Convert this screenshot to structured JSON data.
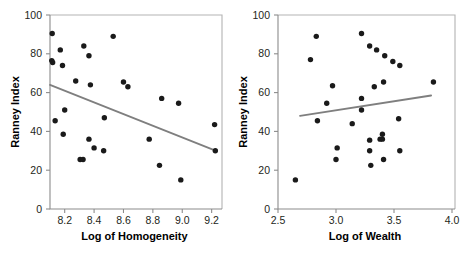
{
  "figure": {
    "background": "#ffffff",
    "dot_color": "#1a1a1a",
    "regression_line_color": "#7f7f7f",
    "axis_color": "#8c8c8c",
    "frame_color": "#b3b3b3"
  },
  "chart_data": [
    {
      "type": "scatter",
      "title": "",
      "xlabel": "Log of Homogeneity",
      "ylabel": "Ranney Index",
      "xlim": [
        8.1,
        9.25
      ],
      "ylim": [
        0,
        100
      ],
      "xticks": [
        8.2,
        8.4,
        8.6,
        8.8,
        9.0,
        9.2
      ],
      "xticklabels": [
        "8.2",
        "8.4",
        "8.6",
        "8.8",
        "9.0",
        "9.2"
      ],
      "yticks": [
        0,
        20,
        40,
        60,
        80,
        100
      ],
      "yticklabels": [
        "0",
        "20",
        "40",
        "60",
        "80",
        "100"
      ],
      "grid": false,
      "legend": "none",
      "points": [
        {
          "x": 8.115,
          "y": 90.5
        },
        {
          "x": 8.112,
          "y": 76.5
        },
        {
          "x": 8.118,
          "y": 75.5
        },
        {
          "x": 8.17,
          "y": 82.0
        },
        {
          "x": 8.185,
          "y": 74.0
        },
        {
          "x": 8.33,
          "y": 84.0
        },
        {
          "x": 8.365,
          "y": 79.0
        },
        {
          "x": 8.53,
          "y": 89.0
        },
        {
          "x": 8.275,
          "y": 66.0
        },
        {
          "x": 8.375,
          "y": 64.0
        },
        {
          "x": 8.6,
          "y": 65.5
        },
        {
          "x": 8.63,
          "y": 63.0
        },
        {
          "x": 8.86,
          "y": 57.0
        },
        {
          "x": 8.975,
          "y": 54.5
        },
        {
          "x": 8.2,
          "y": 51.0
        },
        {
          "x": 8.47,
          "y": 47.0
        },
        {
          "x": 8.135,
          "y": 45.5
        },
        {
          "x": 9.22,
          "y": 43.5
        },
        {
          "x": 8.19,
          "y": 38.5
        },
        {
          "x": 8.365,
          "y": 36.0
        },
        {
          "x": 8.775,
          "y": 36.0
        },
        {
          "x": 8.4,
          "y": 31.5
        },
        {
          "x": 8.465,
          "y": 30.0
        },
        {
          "x": 9.225,
          "y": 30.0
        },
        {
          "x": 8.305,
          "y": 25.5
        },
        {
          "x": 8.325,
          "y": 25.5
        },
        {
          "x": 8.845,
          "y": 22.5
        },
        {
          "x": 8.99,
          "y": 15.0
        }
      ],
      "regression_line": {
        "x0": 8.1,
        "y0": 64.0,
        "x1": 9.23,
        "y1": 30.0
      }
    },
    {
      "type": "scatter",
      "title": "",
      "xlabel": "Log of Wealth",
      "ylabel": "Ranney Index",
      "xlim": [
        2.5,
        4.0
      ],
      "ylim": [
        0,
        100
      ],
      "xticks": [
        2.5,
        3.0,
        3.5,
        4.0
      ],
      "xticklabels": [
        "2.5",
        "3.0",
        "3.5",
        "4.0"
      ],
      "yticks": [
        0,
        20,
        40,
        60,
        80,
        100
      ],
      "yticklabels": [
        "0",
        "20",
        "40",
        "60",
        "80",
        "100"
      ],
      "grid": false,
      "legend": "none",
      "points": [
        {
          "x": 3.22,
          "y": 90.5
        },
        {
          "x": 2.83,
          "y": 89.0
        },
        {
          "x": 3.29,
          "y": 84.0
        },
        {
          "x": 3.35,
          "y": 82.0
        },
        {
          "x": 3.42,
          "y": 79.0
        },
        {
          "x": 2.78,
          "y": 77.0
        },
        {
          "x": 3.49,
          "y": 76.0
        },
        {
          "x": 3.55,
          "y": 74.0
        },
        {
          "x": 3.84,
          "y": 65.5
        },
        {
          "x": 3.41,
          "y": 65.5
        },
        {
          "x": 2.97,
          "y": 63.5
        },
        {
          "x": 3.33,
          "y": 63.0
        },
        {
          "x": 3.22,
          "y": 57.0
        },
        {
          "x": 2.92,
          "y": 54.5
        },
        {
          "x": 3.22,
          "y": 51.0
        },
        {
          "x": 3.54,
          "y": 46.5
        },
        {
          "x": 2.84,
          "y": 45.5
        },
        {
          "x": 3.14,
          "y": 44.0
        },
        {
          "x": 3.4,
          "y": 38.5
        },
        {
          "x": 3.38,
          "y": 36.0
        },
        {
          "x": 3.29,
          "y": 35.5
        },
        {
          "x": 3.4,
          "y": 36.0
        },
        {
          "x": 3.01,
          "y": 31.5
        },
        {
          "x": 3.29,
          "y": 30.0
        },
        {
          "x": 3.55,
          "y": 30.0
        },
        {
          "x": 3.0,
          "y": 25.5
        },
        {
          "x": 3.41,
          "y": 25.5
        },
        {
          "x": 3.3,
          "y": 22.5
        },
        {
          "x": 2.65,
          "y": 15.0
        }
      ],
      "regression_line": {
        "x0": 2.69,
        "y0": 48.0,
        "x1": 3.82,
        "y1": 58.5
      }
    }
  ]
}
